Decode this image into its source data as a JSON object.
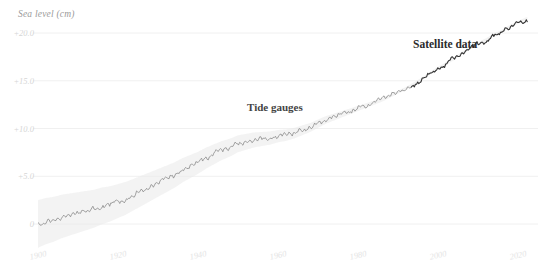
{
  "chart_data": {
    "type": "line",
    "title": "",
    "subtitle": "",
    "xlabel": "",
    "ylabel": "Sea level (cm)",
    "xlim": [
      1893,
      2024
    ],
    "ylim": [
      -2.0,
      22.5
    ],
    "grid": true,
    "legend_position": "inline-annotations",
    "xticks": [
      "1900",
      "1920",
      "1940",
      "1960",
      "1980",
      "2000",
      "2020"
    ],
    "xtick_values": [
      1900,
      1920,
      1940,
      1960,
      1980,
      2000,
      2020
    ],
    "yticks": [
      "0",
      "+5.0",
      "+10.0",
      "+15.0",
      "+20.0"
    ],
    "ytick_values": [
      0,
      5,
      10,
      15,
      20
    ],
    "annotations": [
      {
        "text": "Tide gauges",
        "x": 1963,
        "y": 11.4
      },
      {
        "text": "Satellite data",
        "x": 2007,
        "y": 18.2
      }
    ],
    "series": [
      {
        "name": "Global mean sea level",
        "x": [
          1900,
          1902,
          1904,
          1906,
          1908,
          1910,
          1912,
          1914,
          1916,
          1918,
          1920,
          1922,
          1924,
          1926,
          1928,
          1930,
          1932,
          1934,
          1936,
          1938,
          1940,
          1942,
          1944,
          1946,
          1948,
          1950,
          1952,
          1954,
          1956,
          1958,
          1960,
          1962,
          1964,
          1966,
          1968,
          1970,
          1972,
          1974,
          1976,
          1978,
          1980,
          1982,
          1984,
          1986,
          1988,
          1990,
          1992,
          1994,
          1996,
          1998,
          2000,
          2002,
          2004,
          2006,
          2008,
          2010,
          2012,
          2014,
          2016,
          2018,
          2020,
          2022
        ],
        "values": [
          0.0,
          0.3,
          0.5,
          0.8,
          1.0,
          1.2,
          1.4,
          1.6,
          1.9,
          2.1,
          2.4,
          2.7,
          3.1,
          3.5,
          3.9,
          4.3,
          4.7,
          5.1,
          5.6,
          6.0,
          6.4,
          6.9,
          7.3,
          7.7,
          8.0,
          8.4,
          8.6,
          8.8,
          8.9,
          9.0,
          9.2,
          9.3,
          9.5,
          9.8,
          10.1,
          10.5,
          10.9,
          11.2,
          11.5,
          11.8,
          12.1,
          12.4,
          12.7,
          13.0,
          13.4,
          13.8,
          14.2,
          14.7,
          15.2,
          15.8,
          16.3,
          16.8,
          17.3,
          17.9,
          18.4,
          18.9,
          19.3,
          19.8,
          20.2,
          20.7,
          21.1,
          21.5
        ],
        "uncertainty_band": true,
        "band_label": "uncertainty range"
      }
    ],
    "segments": [
      {
        "name": "Tide gauges",
        "x_start": 1900,
        "x_end": 1993,
        "style": "thin-noisy-grey"
      },
      {
        "name": "Satellite data",
        "x_start": 1993,
        "x_end": 2022,
        "style": "thick-noisy-dark"
      }
    ],
    "colors": {
      "line_tide": "#8a8a8a",
      "line_satellite": "#333333",
      "band": "#e9e9e9",
      "grid": "#f0f0f0",
      "ytick_text": "#d6d6d6",
      "xtick_text": "#e4e4e4",
      "axis_title_text": "#9a9a9a",
      "annotation_text": "#3a3a3a",
      "background": "#ffffff"
    }
  }
}
